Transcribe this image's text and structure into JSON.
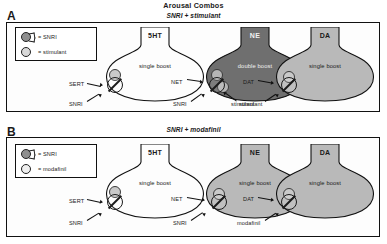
{
  "figure": {
    "title": "Arousal Combos",
    "panels": [
      {
        "letter": "A",
        "subtitle": "SNRI + stimulant",
        "legend": [
          {
            "label": "= SNRI",
            "glyph": "snri-glyph"
          },
          {
            "label": "= stimulant",
            "glyph": "stimulant-glyph"
          }
        ],
        "neurons": [
          {
            "name": "5HT",
            "boost": "single boost",
            "fill": "#fdfdfd",
            "transporter": "SERT",
            "drugs": [
              "SNRI"
            ]
          },
          {
            "name": "NE",
            "boost": "double boost",
            "fill": "#6f6f6f",
            "transporter": "NET",
            "drugs": [
              "SNRI",
              "stimulant"
            ]
          },
          {
            "name": "DA",
            "boost": "single boost",
            "fill": "#b9b9b9",
            "transporter": "DAT",
            "drugs": [
              "stimulant"
            ]
          }
        ]
      },
      {
        "letter": "B",
        "subtitle": "SNRI + modafinil",
        "legend": [
          {
            "label": "= SNRI",
            "glyph": "snri-glyph"
          },
          {
            "label": "= modafinil",
            "glyph": "modafinil-glyph"
          }
        ],
        "neurons": [
          {
            "name": "5HT",
            "boost": "single boost",
            "fill": "#fdfdfd",
            "transporter": "SERT",
            "drugs": [
              "SNRI"
            ]
          },
          {
            "name": "NE",
            "boost": "single boost",
            "fill": "#b9b9b9",
            "transporter": "NET",
            "drugs": [
              "SNRI"
            ]
          },
          {
            "name": "DA",
            "boost": "single boost",
            "fill": "#b9b9b9",
            "transporter": "DAT",
            "drugs": [
              "modafinil"
            ]
          }
        ]
      }
    ]
  }
}
